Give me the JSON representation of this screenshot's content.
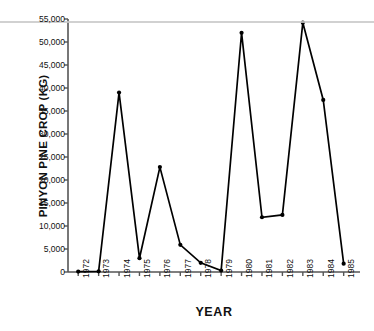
{
  "chart_data": {
    "type": "line",
    "title": "",
    "xlabel": "YEAR",
    "ylabel": "PINYON PINE CROP (KG)",
    "xlim": [
      1971.5,
      1985.8
    ],
    "ylim": [
      0,
      55000
    ],
    "grid": false,
    "legend": null,
    "marker": "filled-circle",
    "line_color": "#000000",
    "categories": [
      "1972",
      "1973",
      "1974",
      "1975",
      "1976",
      "1977",
      "1978",
      "1979",
      "1980",
      "1981",
      "1982",
      "1983",
      "1984",
      "1985"
    ],
    "x": [
      1972,
      1973,
      1974,
      1975,
      1976,
      1977,
      1978,
      1979,
      1980,
      1981,
      1982,
      1983,
      1984,
      1985
    ],
    "values": [
      100,
      150,
      39000,
      3000,
      22800,
      5900,
      2000,
      300,
      52000,
      11900,
      12400,
      54200,
      37400,
      1800
    ],
    "ytick_values": [
      0,
      5000,
      10000,
      15000,
      20000,
      25000,
      30000,
      35000,
      40000,
      45000,
      50000,
      55000
    ],
    "ytick_labels": [
      "0",
      "5,000",
      "10,000",
      "15,000",
      "20,000",
      "25,000",
      "30,000",
      "35,000",
      "40,000",
      "45,000",
      "50,000",
      "55,000"
    ],
    "xtick_labels": [
      "1972",
      "1973",
      "1974",
      "1975",
      "1976",
      "1977",
      "1978",
      "1979",
      "1980",
      "1981",
      "1982",
      "1983",
      "1984",
      "1985"
    ]
  }
}
